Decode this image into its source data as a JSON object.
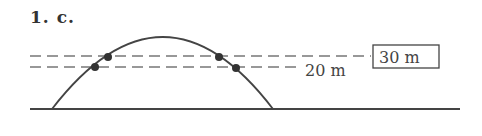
{
  "problem_label": "1. c.",
  "diagram": {
    "heights": [
      {
        "label": "30 m",
        "boxed": true
      },
      {
        "label": "20 m",
        "boxed": false
      }
    ],
    "colors": {
      "stroke": "#444444",
      "dash": "#777777",
      "point": "#333333"
    }
  }
}
